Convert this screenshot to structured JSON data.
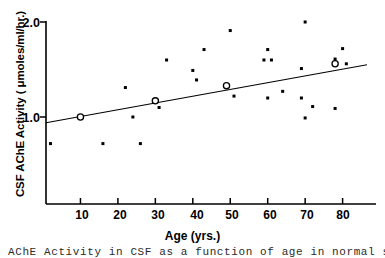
{
  "figure": {
    "background": "#ffffff",
    "ink_color": "#000000"
  },
  "axis": {
    "ylabel": "CSF AChE Activity ( μmoles/ml/hr.)",
    "xlabel": "Age (yrs.)",
    "ytick_labels": [
      "2.0",
      "1.0"
    ],
    "xtick_labels": [
      "10",
      "20",
      "30",
      "40",
      "50",
      "60",
      "70",
      "80"
    ]
  },
  "caption": {
    "text": "AChE Activity in CSF as a function of age in normal subjects"
  },
  "chart_data": {
    "type": "scatter",
    "title": "",
    "xlabel": "Age (yrs.)",
    "ylabel": "CSF AChE Activity ( μmoles/ml/hr.)",
    "xlim": [
      0,
      87
    ],
    "ylim": [
      0.48,
      2.07
    ],
    "xticks": [
      10,
      20,
      30,
      40,
      50,
      60,
      70,
      80
    ],
    "yticks": [
      1.0,
      2.0
    ],
    "grid": false,
    "legend": null,
    "series": [
      {
        "name": "individual subjects",
        "marker": "filled-square",
        "points": [
          {
            "x": 2,
            "y": 0.72
          },
          {
            "x": 16,
            "y": 0.72
          },
          {
            "x": 22,
            "y": 1.31
          },
          {
            "x": 24,
            "y": 1.0
          },
          {
            "x": 26,
            "y": 0.72
          },
          {
            "x": 31,
            "y": 1.1
          },
          {
            "x": 33,
            "y": 1.6
          },
          {
            "x": 40,
            "y": 1.49
          },
          {
            "x": 41,
            "y": 1.39
          },
          {
            "x": 43,
            "y": 1.71
          },
          {
            "x": 50,
            "y": 1.91
          },
          {
            "x": 51,
            "y": 1.22
          },
          {
            "x": 59,
            "y": 1.6
          },
          {
            "x": 60,
            "y": 1.71
          },
          {
            "x": 60,
            "y": 1.2
          },
          {
            "x": 61,
            "y": 1.6
          },
          {
            "x": 64,
            "y": 1.27
          },
          {
            "x": 69,
            "y": 1.51
          },
          {
            "x": 69,
            "y": 1.2
          },
          {
            "x": 70,
            "y": 2.0
          },
          {
            "x": 70,
            "y": 0.99
          },
          {
            "x": 72,
            "y": 1.11
          },
          {
            "x": 78,
            "y": 1.61
          },
          {
            "x": 78,
            "y": 1.09
          },
          {
            "x": 80,
            "y": 1.72
          },
          {
            "x": 81,
            "y": 1.56
          }
        ]
      },
      {
        "name": "decade means",
        "marker": "open-circle",
        "points": [
          {
            "x": 10,
            "y": 1.0
          },
          {
            "x": 30,
            "y": 1.17
          },
          {
            "x": 49,
            "y": 1.33
          },
          {
            "x": 78,
            "y": 1.56
          }
        ]
      }
    ],
    "regression_line": {
      "x_start": 0.8,
      "y_start": 0.94,
      "x_end": 86.5,
      "y_end": 1.55
    }
  }
}
